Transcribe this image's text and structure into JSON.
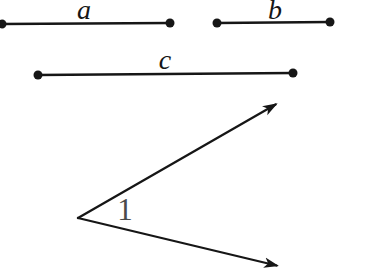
{
  "diagram": {
    "background": "#ffffff",
    "line_color": "#161616",
    "segments": [
      {
        "label": "a"
      },
      {
        "label": "b"
      },
      {
        "label": "c"
      }
    ],
    "angle": {
      "label": "1",
      "label_color": "#4a4a4a"
    }
  }
}
